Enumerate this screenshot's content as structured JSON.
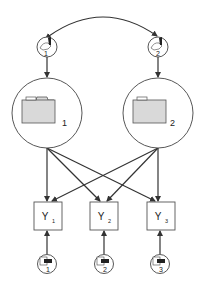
{
  "diagram": {
    "type": "structural-equation-model",
    "latent_factors": [
      {
        "id": "F1",
        "label": "1",
        "icon": "folder-icon"
      },
      {
        "id": "F2",
        "label": "2",
        "icon": "folder-icon"
      }
    ],
    "factor_disturbances": [
      {
        "id": "D1",
        "label": "1",
        "icon": "disturbance-icon"
      },
      {
        "id": "D2",
        "label": "2",
        "icon": "disturbance-icon"
      }
    ],
    "observed": [
      {
        "id": "Y1",
        "label": "Y",
        "sub": "1"
      },
      {
        "id": "Y2",
        "label": "Y",
        "sub": "2"
      },
      {
        "id": "Y3",
        "label": "Y",
        "sub": "3"
      }
    ],
    "errors": [
      {
        "id": "E1",
        "label": "1",
        "icon": "error-icon"
      },
      {
        "id": "E2",
        "label": "2",
        "icon": "error-icon"
      },
      {
        "id": "E3",
        "label": "3",
        "icon": "error-icon"
      }
    ],
    "edges": [
      {
        "from": "D1",
        "to": "D2",
        "type": "covariance"
      },
      {
        "from": "D1",
        "to": "F1",
        "type": "path"
      },
      {
        "from": "D2",
        "to": "F2",
        "type": "path"
      },
      {
        "from": "F1",
        "to": "Y1",
        "type": "loading"
      },
      {
        "from": "F1",
        "to": "Y2",
        "type": "loading"
      },
      {
        "from": "F1",
        "to": "Y3",
        "type": "loading"
      },
      {
        "from": "F2",
        "to": "Y1",
        "type": "loading"
      },
      {
        "from": "F2",
        "to": "Y2",
        "type": "loading"
      },
      {
        "from": "F2",
        "to": "Y3",
        "type": "loading"
      },
      {
        "from": "E1",
        "to": "Y1",
        "type": "path"
      },
      {
        "from": "E2",
        "to": "Y2",
        "type": "path"
      },
      {
        "from": "E3",
        "to": "Y3",
        "type": "path"
      }
    ]
  }
}
